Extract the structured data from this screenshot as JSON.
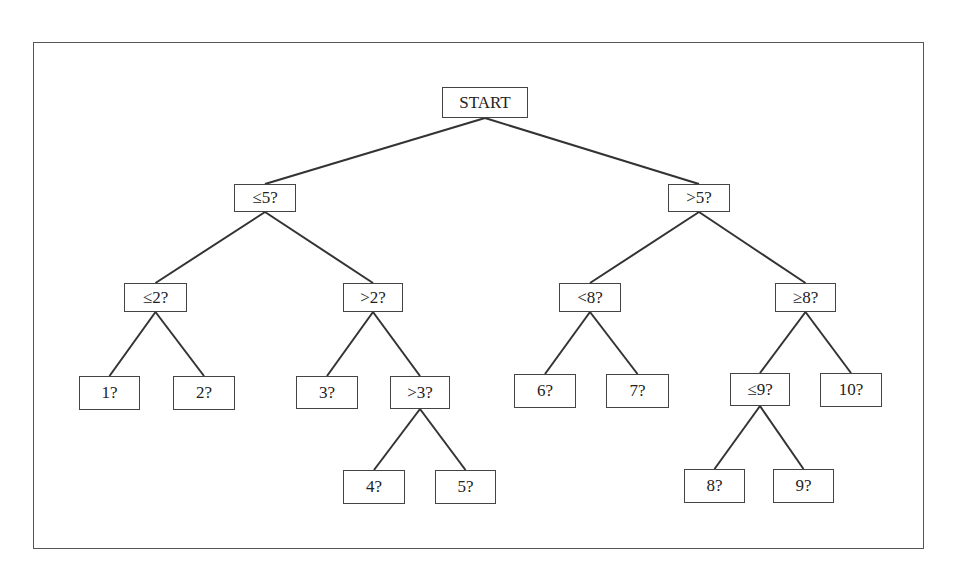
{
  "diagram": {
    "type": "binary decision tree",
    "nodes": [
      {
        "id": "start",
        "label": "START",
        "x": 442,
        "y": 87,
        "w": 86,
        "h": 31
      },
      {
        "id": "le5",
        "label": "≤5?",
        "x": 234,
        "y": 184,
        "w": 62,
        "h": 28
      },
      {
        "id": "gt5",
        "label": ">5?",
        "x": 668,
        "y": 184,
        "w": 62,
        "h": 28
      },
      {
        "id": "le2",
        "label": "≤2?",
        "x": 124,
        "y": 283,
        "w": 63,
        "h": 29
      },
      {
        "id": "gt2",
        "label": ">2?",
        "x": 343,
        "y": 283,
        "w": 60,
        "h": 29
      },
      {
        "id": "lt8",
        "label": "<8?",
        "x": 559,
        "y": 283,
        "w": 62,
        "h": 29
      },
      {
        "id": "ge8",
        "label": "≥8?",
        "x": 775,
        "y": 283,
        "w": 61,
        "h": 29
      },
      {
        "id": "n1",
        "label": "1?",
        "x": 79,
        "y": 376,
        "w": 61,
        "h": 34
      },
      {
        "id": "n2",
        "label": "2?",
        "x": 173,
        "y": 376,
        "w": 62,
        "h": 34
      },
      {
        "id": "n3",
        "label": "3?",
        "x": 296,
        "y": 376,
        "w": 62,
        "h": 33
      },
      {
        "id": "gt3",
        "label": ">3?",
        "x": 390,
        "y": 376,
        "w": 60,
        "h": 33
      },
      {
        "id": "n6",
        "label": "6?",
        "x": 514,
        "y": 374,
        "w": 62,
        "h": 34
      },
      {
        "id": "n7",
        "label": "7?",
        "x": 606,
        "y": 374,
        "w": 63,
        "h": 34
      },
      {
        "id": "le9",
        "label": "≤9?",
        "x": 730,
        "y": 373,
        "w": 60,
        "h": 33
      },
      {
        "id": "n10",
        "label": "10?",
        "x": 820,
        "y": 373,
        "w": 62,
        "h": 34
      },
      {
        "id": "n4",
        "label": "4?",
        "x": 343,
        "y": 470,
        "w": 62,
        "h": 34
      },
      {
        "id": "n5",
        "label": "5?",
        "x": 435,
        "y": 470,
        "w": 61,
        "h": 34
      },
      {
        "id": "n8",
        "label": "8?",
        "x": 684,
        "y": 469,
        "w": 61,
        "h": 34
      },
      {
        "id": "n9",
        "label": "9?",
        "x": 773,
        "y": 469,
        "w": 61,
        "h": 34
      }
    ],
    "edges": [
      [
        "start",
        "le5"
      ],
      [
        "start",
        "gt5"
      ],
      [
        "le5",
        "le2"
      ],
      [
        "le5",
        "gt2"
      ],
      [
        "gt5",
        "lt8"
      ],
      [
        "gt5",
        "ge8"
      ],
      [
        "le2",
        "n1"
      ],
      [
        "le2",
        "n2"
      ],
      [
        "gt2",
        "n3"
      ],
      [
        "gt2",
        "gt3"
      ],
      [
        "gt3",
        "n4"
      ],
      [
        "gt3",
        "n5"
      ],
      [
        "lt8",
        "n6"
      ],
      [
        "lt8",
        "n7"
      ],
      [
        "ge8",
        "le9"
      ],
      [
        "ge8",
        "n10"
      ],
      [
        "le9",
        "n8"
      ],
      [
        "le9",
        "n9"
      ]
    ],
    "colors": {
      "line": "#333333",
      "box_border": "#444444",
      "text": "#222222",
      "background": "#ffffff"
    }
  }
}
